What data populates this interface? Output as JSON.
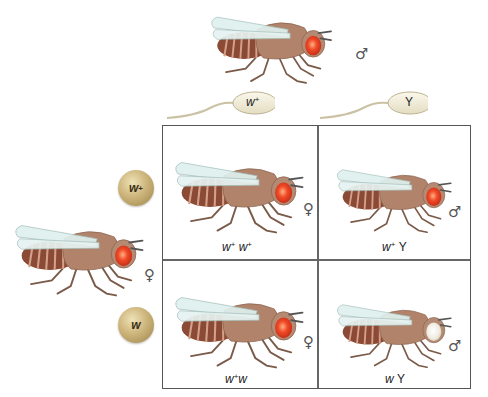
{
  "diagram": {
    "type": "punnett-square",
    "parents": {
      "male": {
        "sex_symbol": "♂",
        "eye_color": "red"
      },
      "female": {
        "sex_symbol": "♀",
        "eye_color": "red"
      }
    },
    "sperm": [
      {
        "label_allele": "w",
        "label_sup": "+",
        "display": "w+"
      },
      {
        "label_allele": "Y",
        "label_sup": "",
        "display": "Y"
      }
    ],
    "eggs": [
      {
        "label_allele": "w",
        "label_sup": "+",
        "display": "w+"
      },
      {
        "label_allele": "w",
        "label_sup": "",
        "display": "w"
      }
    ],
    "cells": [
      {
        "genotype_parts": [
          "w",
          "+",
          "w",
          "+"
        ],
        "genotype": "w+ w+",
        "sex_symbol": "♀",
        "eye_color": "red"
      },
      {
        "genotype_parts": [
          "w",
          "+",
          "",
          "Y"
        ],
        "genotype": "w+ Y",
        "sex_symbol": "♂",
        "eye_color": "red"
      },
      {
        "genotype_parts": [
          "w",
          "+",
          "w",
          ""
        ],
        "genotype": "w+ w",
        "sex_symbol": "♀",
        "eye_color": "red"
      },
      {
        "genotype_parts": [
          "w",
          "",
          "",
          "Y"
        ],
        "genotype": "w Y",
        "sex_symbol": "♂",
        "eye_color": "white"
      }
    ],
    "colors": {
      "body": "#b0836a",
      "abdomen": "#8b4a35",
      "abdomen_stripe": "#d4a089",
      "wing": "#dff0ee",
      "red_eye": "#e8452a",
      "white_eye": "#f2efe6",
      "egg": "#cdb57c",
      "sperm": "#f3efdc",
      "grid_line": "#555555"
    }
  }
}
